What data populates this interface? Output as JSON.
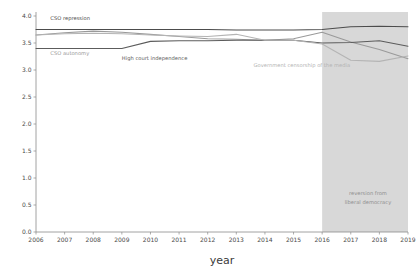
{
  "chart_data": {
    "type": "line",
    "title": "",
    "xlabel": "year",
    "ylabel": "",
    "xlim": [
      2006,
      2019
    ],
    "ylim": [
      0.0,
      4.0
    ],
    "grid": false,
    "legend_position": "inline-labels",
    "x": [
      2006,
      2007,
      2008,
      2009,
      2010,
      2011,
      2012,
      2013,
      2014,
      2015,
      2016,
      2017,
      2018,
      2019
    ],
    "ytick_labels": [
      "0.0",
      "0.5",
      "1.0",
      "1.5",
      "2.0",
      "2.5",
      "3.0",
      "3.5",
      "4.0"
    ],
    "ytick_values": [
      0.0,
      0.5,
      1.0,
      1.5,
      2.0,
      2.5,
      3.0,
      3.5,
      4.0
    ],
    "xtick_labels": [
      "2006",
      "2007",
      "2008",
      "2009",
      "2010",
      "2011",
      "2012",
      "2013",
      "2014",
      "2015",
      "2016",
      "2017",
      "2018",
      "2019"
    ],
    "series": [
      {
        "name": "CSO repression",
        "color": "#4c4c4c",
        "label_x": 2006.5,
        "label_y": 3.93,
        "values": [
          3.75,
          3.75,
          3.75,
          3.75,
          3.75,
          3.75,
          3.75,
          3.74,
          3.74,
          3.74,
          3.75,
          3.8,
          3.81,
          3.8
        ]
      },
      {
        "name": "CSO autonomy",
        "color": "#9a9a9a",
        "label_x": 2006.5,
        "label_y": 3.28,
        "values": [
          3.65,
          3.69,
          3.72,
          3.7,
          3.66,
          3.62,
          3.58,
          3.57,
          3.55,
          3.58,
          3.7,
          3.52,
          3.38,
          3.21
        ]
      },
      {
        "name": "High court independence",
        "color": "#5c5c5c",
        "label_x": 2009.0,
        "label_y": 3.19,
        "values": [
          3.4,
          3.4,
          3.4,
          3.4,
          3.53,
          3.54,
          3.54,
          3.55,
          3.55,
          3.55,
          3.5,
          3.51,
          3.54,
          3.44
        ]
      },
      {
        "name": "Government censorship of the media",
        "color": "#b4b4b4",
        "label_x": 2013.6,
        "label_y": 3.06,
        "values": [
          3.65,
          3.67,
          3.68,
          3.67,
          3.65,
          3.63,
          3.62,
          3.66,
          3.55,
          3.55,
          3.48,
          3.18,
          3.16,
          3.26
        ]
      }
    ],
    "shaded_region": {
      "name": "reversion from liberal democracy",
      "x_start": 2016,
      "x_end": 2019,
      "color": "#d8d8d8",
      "annotation_lines": [
        "reversion from",
        "liberal democracy"
      ],
      "annotation_x": 2017.6,
      "annotation_y_top": 0.68,
      "annotation_y_bottom": 0.52
    }
  }
}
